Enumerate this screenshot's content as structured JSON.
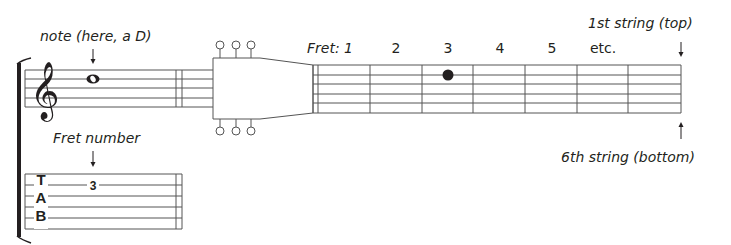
{
  "labels": {
    "note": "note (here, a D)",
    "fret_number": "Fret number",
    "first_string": "1st string (top)",
    "sixth_string": "6th string (bottom)",
    "fret_prefix": "Fret: 1"
  },
  "fretboard": {
    "fret_labels": [
      "2",
      "3",
      "4",
      "5",
      "etc."
    ],
    "dot": {
      "fret": 3,
      "string": 2
    }
  },
  "tab": {
    "letters": [
      "T",
      "A",
      "B"
    ],
    "number": "3"
  },
  "colors": {
    "ink": "#231f20",
    "line": "#555555"
  }
}
